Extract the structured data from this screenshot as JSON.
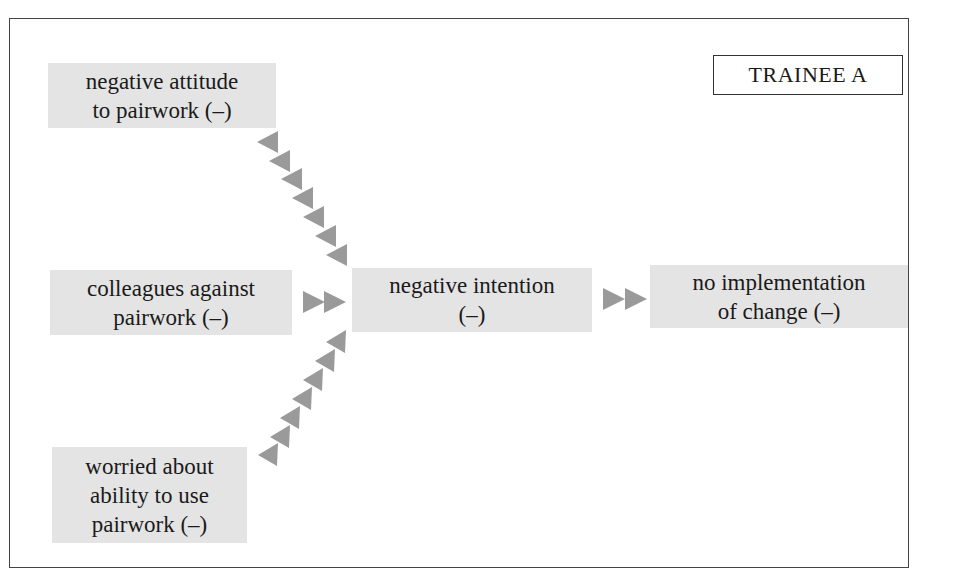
{
  "diagram": {
    "title_label": "TRAINEE A",
    "colors": {
      "node_fill": "#e4e4e4",
      "arrow_fill": "#9a9a9a",
      "border": "#444444"
    },
    "nodes": [
      {
        "id": "attitude",
        "lines": [
          "negative attitude",
          "to pairwork (–)"
        ]
      },
      {
        "id": "colleagues",
        "lines": [
          "colleagues against",
          "pairwork (–)"
        ]
      },
      {
        "id": "intention",
        "lines": [
          "negative intention",
          "(–)"
        ]
      },
      {
        "id": "implementation",
        "lines": [
          "no implementation",
          "of change (–)"
        ]
      },
      {
        "id": "worried",
        "lines": [
          "worried about",
          "ability to use",
          "pairwork (–)"
        ]
      }
    ],
    "edges": [
      {
        "from": "attitude",
        "to": "intention",
        "style": "diagonal-chevron-chain"
      },
      {
        "from": "colleagues",
        "to": "intention",
        "style": "double-chevron"
      },
      {
        "from": "worried",
        "to": "intention",
        "style": "diagonal-chevron-chain"
      },
      {
        "from": "intention",
        "to": "implementation",
        "style": "double-chevron"
      }
    ]
  }
}
